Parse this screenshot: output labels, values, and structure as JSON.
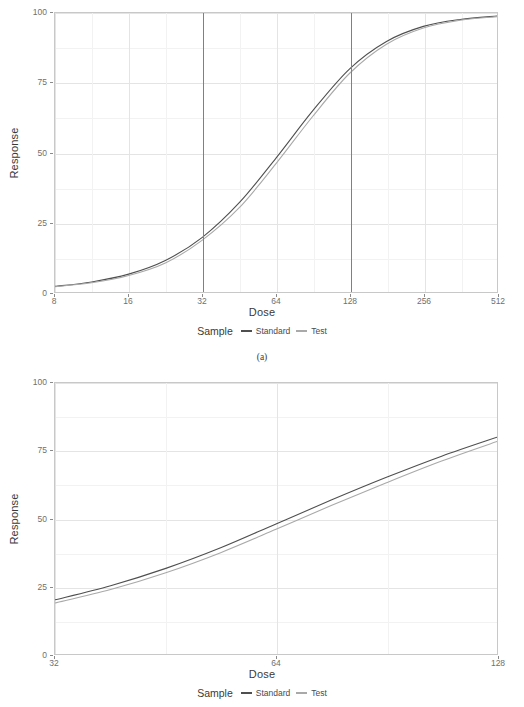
{
  "figure": {
    "panels": [
      {
        "id": "a",
        "caption": "(a)",
        "axis": {
          "xlabel": "Dose",
          "ylabel": "Response",
          "xticks": [
            "8",
            "16",
            "32",
            "64",
            "128",
            "256",
            "512"
          ],
          "yticks": [
            "0",
            "25",
            "50",
            "75",
            "100"
          ]
        },
        "legend": {
          "title": "Sample",
          "items": [
            {
              "label": "Standard",
              "color": "#4f4f4f"
            },
            {
              "label": "Test",
              "color": "#a9a9a9"
            }
          ]
        }
      },
      {
        "id": "b",
        "caption": "",
        "axis": {
          "xlabel": "Dose",
          "ylabel": "Response",
          "xticks": [
            "32",
            "64",
            "128"
          ],
          "yticks": [
            "0",
            "25",
            "50",
            "75",
            "100"
          ]
        },
        "legend": {
          "title": "Sample",
          "items": [
            {
              "label": "Standard",
              "color": "#4f4f4f"
            },
            {
              "label": "Test",
              "color": "#a9a9a9"
            }
          ]
        }
      }
    ]
  },
  "chart_data": [
    {
      "type": "line",
      "panel": "a",
      "title": "",
      "subtitle": "(a)",
      "xlabel": "Dose",
      "ylabel": "Response",
      "xscale": "log2",
      "xlim": [
        8,
        512
      ],
      "ylim": [
        0,
        100
      ],
      "xticks": [
        8,
        16,
        32,
        64,
        128,
        256,
        512
      ],
      "yticks": [
        0,
        25,
        50,
        75,
        100
      ],
      "grid": true,
      "legend": {
        "title": "Sample",
        "position": "bottom"
      },
      "annotations": [
        {
          "type": "vline",
          "x": 32,
          "color": "#808080"
        },
        {
          "type": "vline",
          "x": 128,
          "color": "#808080"
        }
      ],
      "x": [
        8,
        11.3,
        16,
        22.6,
        32,
        45.3,
        64,
        90.5,
        128,
        181,
        256,
        362,
        512
      ],
      "series": [
        {
          "name": "Standard",
          "color": "#4f4f4f",
          "values": [
            2.0,
            3.6,
            6.4,
            11.3,
            19.6,
            32.0,
            48.0,
            65.0,
            80.0,
            89.8,
            95.2,
            97.7,
            98.9
          ]
        },
        {
          "name": "Test",
          "color": "#a9a9a9",
          "values": [
            1.9,
            3.3,
            5.9,
            10.4,
            18.6,
            30.2,
            46.0,
            63.0,
            78.4,
            88.8,
            94.6,
            97.4,
            98.7
          ]
        }
      ]
    },
    {
      "type": "line",
      "panel": "b",
      "title": "",
      "subtitle": "",
      "xlabel": "Dose",
      "ylabel": "Response",
      "xscale": "log2",
      "xlim": [
        32,
        128
      ],
      "ylim": [
        0,
        100
      ],
      "xticks": [
        32,
        64,
        128
      ],
      "yticks": [
        0,
        25,
        50,
        75,
        100
      ],
      "grid": true,
      "legend": {
        "title": "Sample",
        "position": "bottom"
      },
      "annotations": [],
      "x": [
        32,
        38.1,
        45.3,
        53.8,
        64,
        76.1,
        90.5,
        107.6,
        128
      ],
      "series": [
        {
          "name": "Standard",
          "color": "#4f4f4f",
          "values": [
            20.0,
            25.2,
            31.6,
            39.2,
            48.0,
            56.8,
            65.2,
            73.0,
            80.0
          ]
        },
        {
          "name": "Test",
          "color": "#a9a9a9",
          "values": [
            18.8,
            23.8,
            30.0,
            37.4,
            46.0,
            54.8,
            63.2,
            71.2,
            78.4
          ]
        }
      ]
    }
  ]
}
